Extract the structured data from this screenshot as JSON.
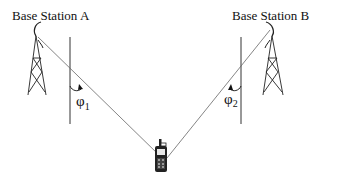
{
  "diagram": {
    "title": "",
    "nodes": [
      {
        "id": "bs_a",
        "label": "Base Station A",
        "type": "cell-tower"
      },
      {
        "id": "bs_b",
        "label": "Base Station B",
        "type": "cell-tower"
      },
      {
        "id": "mobile",
        "label": "",
        "type": "mobile-phone"
      }
    ],
    "edges": [
      {
        "from": "bs_a",
        "to": "mobile",
        "style": "thin-line"
      },
      {
        "from": "bs_b",
        "to": "mobile",
        "style": "thin-line"
      }
    ],
    "angles": [
      {
        "id": "phi1",
        "symbol": "φ",
        "subscript": "1",
        "at": "bs_a",
        "between": [
          "vertical-reference",
          "line-to-mobile"
        ]
      },
      {
        "id": "phi2",
        "symbol": "φ",
        "subscript": "2",
        "at": "bs_b",
        "between": [
          "vertical-reference",
          "line-to-mobile"
        ]
      }
    ]
  },
  "labels": {
    "station_a": "Base Station A",
    "station_b": "Base Station B",
    "phi_symbol": "φ",
    "phi1_sub": "1",
    "phi2_sub": "2"
  },
  "colors": {
    "ink": "#111111",
    "line": "#555555",
    "background": "#ffffff"
  }
}
